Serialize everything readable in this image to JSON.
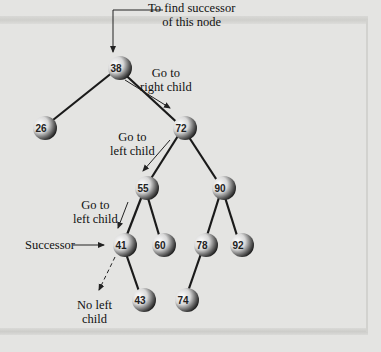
{
  "diagram": {
    "nodes": [
      {
        "id": "n38",
        "value": "38",
        "x": 118,
        "y": 68
      },
      {
        "id": "n26",
        "value": "26",
        "x": 43,
        "y": 128
      },
      {
        "id": "n72",
        "value": "72",
        "x": 183,
        "y": 128
      },
      {
        "id": "n55",
        "value": "55",
        "x": 145,
        "y": 188
      },
      {
        "id": "n90",
        "value": "90",
        "x": 222,
        "y": 188
      },
      {
        "id": "n41",
        "value": "41",
        "x": 123,
        "y": 245
      },
      {
        "id": "n60",
        "value": "60",
        "x": 162,
        "y": 245
      },
      {
        "id": "n78",
        "value": "78",
        "x": 204,
        "y": 245
      },
      {
        "id": "n92",
        "value": "92",
        "x": 240,
        "y": 245
      },
      {
        "id": "n43",
        "value": "43",
        "x": 142,
        "y": 300
      },
      {
        "id": "n74",
        "value": "74",
        "x": 185,
        "y": 300
      }
    ],
    "edges": [
      [
        "n38",
        "n26"
      ],
      [
        "n38",
        "n72"
      ],
      [
        "n72",
        "n55"
      ],
      [
        "n72",
        "n90"
      ],
      [
        "n55",
        "n41"
      ],
      [
        "n55",
        "n60"
      ],
      [
        "n90",
        "n78"
      ],
      [
        "n90",
        "n92"
      ],
      [
        "n41",
        "n43"
      ],
      [
        "n78",
        "n74"
      ]
    ],
    "annotations": {
      "start": {
        "line1": "To find successor",
        "line2": "of this node"
      },
      "step1": {
        "line1": "Go to",
        "line2": "right child"
      },
      "step2": {
        "line1": "Go to",
        "line2": "left child"
      },
      "step3": {
        "line1": "Go to",
        "line2": "left child"
      },
      "successor": "Successor",
      "no_left": {
        "line1": "No left",
        "line2": "child"
      }
    }
  }
}
